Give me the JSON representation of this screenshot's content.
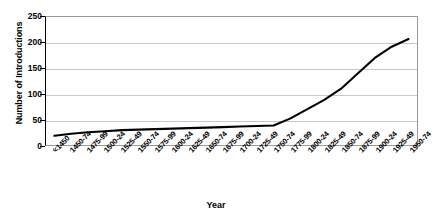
{
  "chart_data": {
    "type": "line",
    "title": "",
    "xlabel": "Year",
    "ylabel": "Number of Introductions",
    "ylim": [
      0,
      250
    ],
    "yticks": [
      0,
      50,
      100,
      150,
      200,
      250
    ],
    "grid": true,
    "legend": "none",
    "line_color": "#000000",
    "categories": [
      "<1450",
      "1450-74",
      "1475-99",
      "1500-24",
      "1525-49",
      "1550-74",
      "1575-99",
      "1600-24",
      "1625-49",
      "1650-74",
      "1675-99",
      "1700-24",
      "1725-49",
      "1750-74",
      "1775-99",
      "1800-24",
      "1825-49",
      "1850-74",
      "1875-99",
      "1900-24",
      "1925-49",
      "1950-74"
    ],
    "values": [
      18,
      22,
      25,
      27,
      29,
      30,
      31,
      32,
      33,
      34,
      35,
      36,
      37,
      38,
      52,
      70,
      88,
      110,
      140,
      170,
      192,
      207
    ]
  }
}
